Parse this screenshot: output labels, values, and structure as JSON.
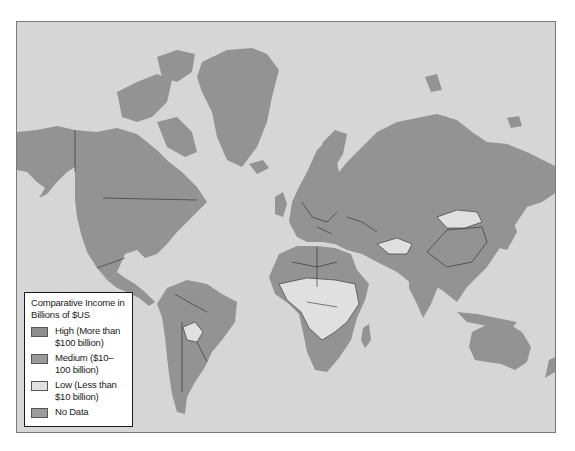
{
  "map": {
    "title": "Comparative Income in Billions of $US",
    "ocean_color": "#d6d6d6",
    "border_color": "#2a2a2a",
    "regions": {
      "high": [
        "North America (USA, Canada)",
        "Greenland",
        "Russia",
        "China",
        "Japan",
        "Western Europe",
        "Brazil",
        "Mexico",
        "India",
        "Australia",
        "Argentina",
        "Saudi Arabia",
        "Indonesia"
      ],
      "medium": [
        "Colombia",
        "Venezuela",
        "Peru",
        "Chile",
        "Kazakhstan",
        "Iran",
        "Pakistan",
        "Egypt",
        "Algeria",
        "South Africa",
        "Nigeria",
        "Thailand",
        "Philippines",
        "New Zealand"
      ],
      "low": [
        "Bolivia",
        "Mongolia",
        "Most of Sub-Saharan Africa",
        "Afghanistan",
        "Laos",
        "Madagascar",
        "Central Asian states"
      ]
    }
  },
  "legend": {
    "title": "Comparative Income in Billions of $US",
    "items": [
      {
        "label": "High (More than $100 billion)",
        "color": "#8e8e8e"
      },
      {
        "label": "Medium ($10–100 billion)",
        "color": "#9a9a9a"
      },
      {
        "label": "Low (Less than $10 billion)",
        "color": "#e2e2e2"
      },
      {
        "label": "No Data",
        "color": "#9c9c9c"
      }
    ]
  }
}
